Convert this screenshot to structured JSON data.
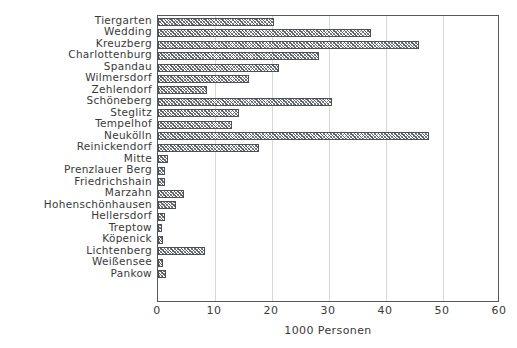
{
  "chart_data": {
    "type": "bar",
    "orientation": "horizontal",
    "title": "",
    "xlabel": "1000 Personen",
    "ylabel": "",
    "xlim": [
      0,
      60
    ],
    "xticks": [
      0,
      10,
      20,
      30,
      40,
      50,
      60
    ],
    "grid": true,
    "legend": "none",
    "categories": [
      "Tiergarten",
      "Wedding",
      "Kreuzberg",
      "Charlottenburg",
      "Spandau",
      "Wilmersdorf",
      "Zehlendorf",
      "Schöneberg",
      "Steglitz",
      "Tempelhof",
      "Neukölln",
      "Reinickendorf",
      "Mitte",
      "Prenzlauer Berg",
      "Friedrichshain",
      "Marzahn",
      "Hohenschönhausen",
      "Hellersdorf",
      "Treptow",
      "Köpenick",
      "Lichtenberg",
      "Weißensee",
      "Pankow"
    ],
    "values": [
      20.3,
      37.4,
      45.8,
      28.3,
      21.2,
      16.0,
      8.6,
      30.5,
      14.2,
      13.0,
      47.5,
      17.7,
      1.7,
      1.2,
      1.2,
      4.5,
      3.1,
      1.3,
      0.7,
      0.9,
      8.2,
      0.8,
      1.4
    ]
  },
  "style": {
    "bar_edge_color": "#4c5056",
    "bar_hatch": "crosshatch",
    "frame_color": "#555a60",
    "grid_color": "#d5d7da",
    "text_color": "#3a3a3a",
    "background": "#ffffff"
  }
}
